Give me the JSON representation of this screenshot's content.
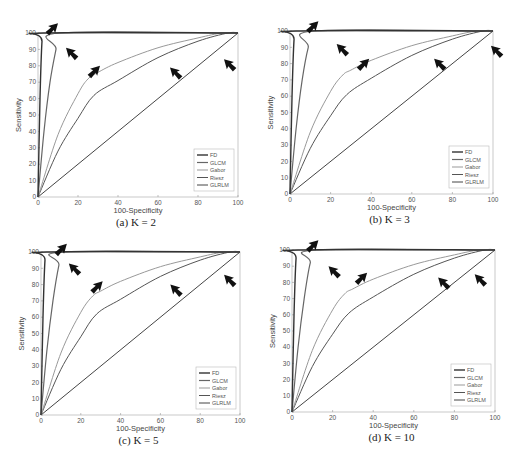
{
  "chart_data": [
    {
      "type": "line",
      "panel": "a",
      "title": "(a) K = 2",
      "xlabel": "100-Specificity",
      "ylabel": "Sensitivity",
      "xlim": [
        0,
        100
      ],
      "ylim": [
        0,
        100
      ],
      "xticks": [
        0,
        20,
        40,
        60,
        80,
        100
      ],
      "yticks": [
        0,
        10,
        20,
        30,
        40,
        50,
        60,
        70,
        80,
        90,
        100
      ],
      "grid": false,
      "legend_position": "lower right",
      "series": [
        {
          "name": "FD",
          "color": "#333333",
          "width": 1.4,
          "points": [
            [
              0,
              0
            ],
            [
              1,
              60
            ],
            [
              2,
              95
            ],
            [
              3,
              100
            ],
            [
              100,
              100
            ]
          ]
        },
        {
          "name": "GLCM",
          "color": "#666666",
          "width": 1.2,
          "points": [
            [
              0,
              0
            ],
            [
              3,
              40
            ],
            [
              6,
              70
            ],
            [
              9,
              90
            ],
            [
              11,
              100
            ],
            [
              100,
              100
            ]
          ]
        },
        {
          "name": "Gabor",
          "color": "#999999",
          "width": 1.0,
          "points": [
            [
              0,
              0
            ],
            [
              10,
              38
            ],
            [
              20,
              63
            ],
            [
              25,
              72
            ],
            [
              30,
              76
            ],
            [
              40,
              82
            ],
            [
              60,
              91
            ],
            [
              80,
              97
            ],
            [
              92,
              100
            ],
            [
              100,
              100
            ]
          ]
        },
        {
          "name": "Riesz",
          "color": "#555555",
          "width": 1.0,
          "points": [
            [
              0,
              0
            ],
            [
              10,
              28
            ],
            [
              20,
              48
            ],
            [
              28,
              62
            ],
            [
              40,
              71
            ],
            [
              60,
              85
            ],
            [
              80,
              95
            ],
            [
              95,
              100
            ],
            [
              100,
              100
            ]
          ]
        },
        {
          "name": "GLRLM",
          "color": "#444444",
          "width": 1.0,
          "points": [
            [
              0,
              0
            ],
            [
              100,
              100
            ]
          ]
        }
      ],
      "arrows": [
        [
          10,
          106,
          "down-left"
        ],
        [
          14,
          91,
          "up-left"
        ],
        [
          31,
          80,
          "down-left"
        ],
        [
          66,
          79,
          "up-left"
        ],
        [
          93,
          84,
          "up-left"
        ]
      ]
    },
    {
      "type": "line",
      "panel": "b",
      "title": "(b) K = 3",
      "xlabel": "100-Specificity",
      "ylabel": "Sensitivity",
      "xlim": [
        0,
        100
      ],
      "ylim": [
        0,
        100
      ],
      "xticks": [
        0,
        20,
        40,
        60,
        80,
        100
      ],
      "yticks": [
        0,
        10,
        20,
        30,
        40,
        50,
        60,
        70,
        80,
        90,
        100
      ],
      "grid": false,
      "legend_position": "lower right",
      "series": [
        {
          "name": "FD",
          "color": "#333333",
          "width": 1.4,
          "points": [
            [
              0,
              0
            ],
            [
              1,
              60
            ],
            [
              2,
              95
            ],
            [
              3,
              100
            ],
            [
              100,
              100
            ]
          ]
        },
        {
          "name": "GLCM",
          "color": "#666666",
          "width": 1.2,
          "points": [
            [
              0,
              0
            ],
            [
              3,
              40
            ],
            [
              6,
              70
            ],
            [
              9,
              90
            ],
            [
              12,
              100
            ],
            [
              100,
              100
            ]
          ]
        },
        {
          "name": "Gabor",
          "color": "#999999",
          "width": 1.0,
          "points": [
            [
              0,
              0
            ],
            [
              10,
              38
            ],
            [
              20,
              63
            ],
            [
              26,
              73
            ],
            [
              30,
              76
            ],
            [
              40,
              82
            ],
            [
              60,
              91
            ],
            [
              80,
              97
            ],
            [
              92,
              100
            ],
            [
              100,
              100
            ]
          ]
        },
        {
          "name": "Riesz",
          "color": "#555555",
          "width": 1.0,
          "points": [
            [
              0,
              0
            ],
            [
              10,
              28
            ],
            [
              20,
              48
            ],
            [
              28,
              61
            ],
            [
              40,
              71
            ],
            [
              60,
              85
            ],
            [
              80,
              95
            ],
            [
              95,
              100
            ],
            [
              100,
              100
            ]
          ]
        },
        {
          "name": "GLRLM",
          "color": "#444444",
          "width": 1.0,
          "points": [
            [
              0,
              0
            ],
            [
              100,
              100
            ]
          ]
        }
      ],
      "arrows": [
        [
          14,
          106,
          "down-left"
        ],
        [
          23,
          92,
          "up-left"
        ],
        [
          39,
          83,
          "down-left"
        ],
        [
          71,
          83,
          "up-left"
        ],
        [
          99,
          91,
          "up-left"
        ]
      ]
    },
    {
      "type": "line",
      "panel": "c",
      "title": "(c) K = 5",
      "xlabel": "100-Specificity",
      "ylabel": "Sensitivity",
      "xlim": [
        0,
        100
      ],
      "ylim": [
        0,
        100
      ],
      "xticks": [
        0,
        20,
        40,
        60,
        80,
        100
      ],
      "yticks": [
        0,
        10,
        20,
        30,
        40,
        50,
        60,
        70,
        80,
        90,
        100
      ],
      "grid": false,
      "legend_position": "lower right",
      "series": [
        {
          "name": "FD",
          "color": "#333333",
          "width": 1.4,
          "points": [
            [
              0,
              0
            ],
            [
              1,
              60
            ],
            [
              2,
              95
            ],
            [
              3,
              100
            ],
            [
              100,
              100
            ]
          ]
        },
        {
          "name": "GLCM",
          "color": "#666666",
          "width": 1.2,
          "points": [
            [
              0,
              0
            ],
            [
              3,
              40
            ],
            [
              6,
              70
            ],
            [
              9,
              92
            ],
            [
              11,
              100
            ],
            [
              100,
              100
            ]
          ]
        },
        {
          "name": "Gabor",
          "color": "#999999",
          "width": 1.0,
          "points": [
            [
              0,
              0
            ],
            [
              10,
              38
            ],
            [
              20,
              63
            ],
            [
              26,
              73
            ],
            [
              30,
              76
            ],
            [
              40,
              82
            ],
            [
              60,
              91
            ],
            [
              80,
              97
            ],
            [
              92,
              100
            ],
            [
              100,
              100
            ]
          ]
        },
        {
          "name": "Riesz",
          "color": "#555555",
          "width": 1.0,
          "points": [
            [
              0,
              0
            ],
            [
              10,
              28
            ],
            [
              20,
              48
            ],
            [
              28,
              62
            ],
            [
              40,
              71
            ],
            [
              60,
              85
            ],
            [
              80,
              95
            ],
            [
              95,
              100
            ],
            [
              100,
              100
            ]
          ]
        },
        {
          "name": "GLRLM",
          "color": "#444444",
          "width": 1.0,
          "points": [
            [
              0,
              0
            ],
            [
              100,
              100
            ]
          ]
        }
      ],
      "arrows": [
        [
          13,
          105,
          "down-left"
        ],
        [
          14,
          93,
          "up-left"
        ],
        [
          31,
          82,
          "down-left"
        ],
        [
          65,
          80,
          "up-left"
        ],
        [
          92,
          86,
          "up-left"
        ]
      ]
    },
    {
      "type": "line",
      "panel": "d",
      "title": "(d) K = 10",
      "xlabel": "100-Specificity",
      "ylabel": "Sensitivity",
      "xlim": [
        0,
        100
      ],
      "ylim": [
        0,
        100
      ],
      "xticks": [
        0,
        20,
        40,
        60,
        80,
        100
      ],
      "yticks": [
        0,
        10,
        20,
        30,
        40,
        50,
        60,
        70,
        80,
        90,
        100
      ],
      "grid": false,
      "legend_position": "lower right",
      "series": [
        {
          "name": "FD",
          "color": "#333333",
          "width": 1.4,
          "points": [
            [
              0,
              0
            ],
            [
              1,
              60
            ],
            [
              2,
              95
            ],
            [
              3,
              100
            ],
            [
              100,
              100
            ]
          ]
        },
        {
          "name": "GLCM",
          "color": "#666666",
          "width": 1.2,
          "points": [
            [
              0,
              0
            ],
            [
              3,
              40
            ],
            [
              6,
              70
            ],
            [
              9,
              92
            ],
            [
              12,
              100
            ],
            [
              100,
              100
            ]
          ]
        },
        {
          "name": "Gabor",
          "color": "#999999",
          "width": 1.0,
          "points": [
            [
              0,
              0
            ],
            [
              10,
              38
            ],
            [
              20,
              63
            ],
            [
              26,
              73
            ],
            [
              30,
              76
            ],
            [
              40,
              82
            ],
            [
              60,
              91
            ],
            [
              80,
              97
            ],
            [
              92,
              100
            ],
            [
              100,
              100
            ]
          ]
        },
        {
          "name": "Riesz",
          "color": "#555555",
          "width": 1.0,
          "points": [
            [
              0,
              0
            ],
            [
              10,
              28
            ],
            [
              20,
              48
            ],
            [
              28,
              61
            ],
            [
              40,
              71
            ],
            [
              60,
              85
            ],
            [
              80,
              95
            ],
            [
              95,
              100
            ],
            [
              100,
              100
            ]
          ]
        },
        {
          "name": "GLRLM",
          "color": "#444444",
          "width": 1.0,
          "points": [
            [
              0,
              0
            ],
            [
              100,
              100
            ]
          ]
        }
      ],
      "arrows": [
        [
          13,
          106,
          "down-left"
        ],
        [
          18,
          90,
          "up-left"
        ],
        [
          37,
          86,
          "down-left"
        ],
        [
          72,
          83,
          "up-left"
        ],
        [
          90,
          85,
          "up-left"
        ]
      ]
    }
  ],
  "panels": [
    {
      "caption": "(a) K = 2",
      "box": {
        "x0": 38,
        "x1": 238,
        "y0": 33,
        "y1": 197
      },
      "legend": [
        "FD",
        "GLCM",
        "Gabor",
        "Riesz",
        "GLRLM"
      ]
    },
    {
      "caption": "(b) K = 3",
      "box": {
        "x0": 290,
        "x1": 493,
        "y0": 31,
        "y1": 194
      },
      "legend": [
        "FD",
        "GLCM",
        "Gabor",
        "Riesz",
        "GLRLM"
      ]
    },
    {
      "caption": "(c) K = 5",
      "box": {
        "x0": 41,
        "x1": 240,
        "y0": 252,
        "y1": 415
      },
      "legend": [
        "FD",
        "GLCM",
        "Gabor",
        "Riesz",
        "GLRLM"
      ]
    },
    {
      "caption": "(d) K = 10",
      "box": {
        "x0": 292,
        "x1": 495,
        "y0": 250,
        "y1": 412
      },
      "legend": [
        "FD",
        "GLCM",
        "Gabor",
        "Riesz",
        "GLRLM"
      ]
    }
  ],
  "axis_labels": {
    "x": "100-Specificity",
    "y": "Sensitivity"
  }
}
